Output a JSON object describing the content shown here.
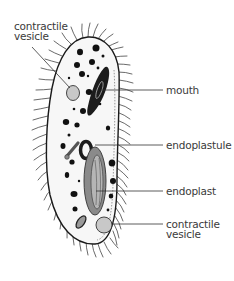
{
  "diagram": {
    "labels": [
      {
        "id": "contractile-vesicle-top",
        "lines": [
          "contractile",
          "vesicle"
        ]
      },
      {
        "id": "mouth",
        "lines": [
          "mouth"
        ]
      },
      {
        "id": "endoplastule",
        "lines": [
          "endoplastule"
        ]
      },
      {
        "id": "endoplast",
        "lines": [
          "endoplast"
        ]
      },
      {
        "id": "contractile-vesicle-bottom",
        "lines": [
          "contractile",
          "vesicle"
        ]
      }
    ],
    "colors": {
      "outline": "#1a1a1a",
      "body_fill": "#f7f7f7",
      "vesicle_fill": "#c8c8c8",
      "endoplast_fill": "#8a8a8a",
      "mouth_fill": "#1c1c1c",
      "text": "#3a3a3a",
      "leader_line": "#333333"
    }
  }
}
